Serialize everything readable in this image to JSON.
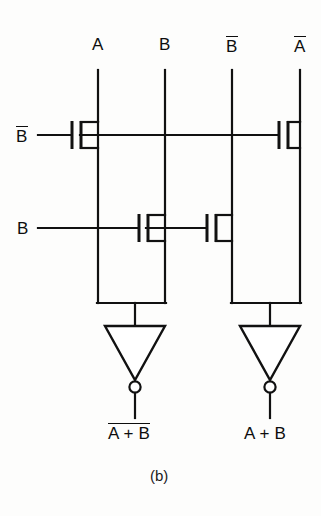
{
  "figure": {
    "caption": "(b)",
    "kind": "cmos-nor-or-transistor-schematic",
    "ink_color": "#111111",
    "background_color": "#fdfdfc"
  },
  "top_inputs": [
    {
      "label": "A",
      "overline": false,
      "x": 98
    },
    {
      "label": "B",
      "overline": false,
      "x": 165
    },
    {
      "label": "B",
      "overline": true,
      "x": 232
    },
    {
      "label": "A",
      "overline": true,
      "x": 300
    }
  ],
  "side_inputs": [
    {
      "label": "B",
      "overline": true,
      "y": 135
    },
    {
      "label": "B",
      "overline": false,
      "y": 228
    }
  ],
  "outputs": [
    {
      "label": "A + B",
      "overline": true,
      "x": 135
    },
    {
      "label": "A + B",
      "overline": false,
      "x": 270
    }
  ],
  "transistors": [
    {
      "name": "pmos-left-bbar",
      "gate_x": 74,
      "row_y": 135
    },
    {
      "name": "pmos-right-bbar",
      "gate_x": 280,
      "row_y": 135
    },
    {
      "name": "nmos-left-b",
      "gate_x": 140,
      "row_y": 228
    },
    {
      "name": "nmos-right-b",
      "gate_x": 208,
      "row_y": 228
    }
  ],
  "inverters": [
    {
      "name": "inverter-left",
      "x": 135,
      "top_y": 325,
      "bottom_y": 400
    },
    {
      "name": "inverter-right",
      "x": 270,
      "top_y": 325,
      "bottom_y": 400
    }
  ],
  "buses": [
    {
      "name": "output-bus-left",
      "y": 303,
      "x1": 98,
      "x2": 168
    },
    {
      "name": "output-bus-right",
      "y": 303,
      "x1": 232,
      "x2": 302
    }
  ]
}
